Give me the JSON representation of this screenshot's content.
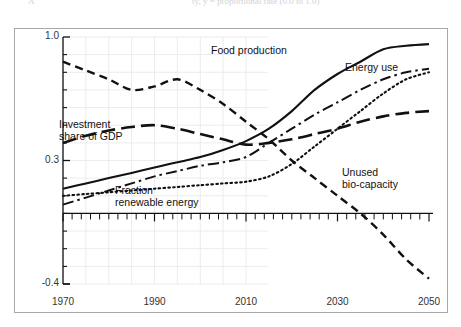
{
  "figure": {
    "cut_caption_left": "A",
    "cut_caption_right": "ty, y = proportional rate (0.0 to 1.0)",
    "frame_name": "figure-border"
  },
  "axes": {
    "y_ticks": [
      {
        "value": 1.0,
        "label": "1.0"
      },
      {
        "value": 0.3,
        "label": "0.3"
      },
      {
        "value": -0.4,
        "label": "-0.4"
      }
    ],
    "y_min": -0.4,
    "y_max": 1.0,
    "x_ticks": [
      {
        "value": 1970,
        "label": "1970"
      },
      {
        "value": 1990,
        "label": "1990"
      },
      {
        "value": 2010,
        "label": "2010"
      },
      {
        "value": 2030,
        "label": "2030"
      },
      {
        "value": 2050,
        "label": "2050"
      }
    ],
    "x_min": 1970,
    "x_max": 2050,
    "x_minor_tick_step": 2,
    "zero_line_value": 0,
    "grid": "faint light-grey grid in left portion only"
  },
  "series_labels": {
    "food_production": "Food production",
    "energy_use": "Energy use",
    "investment_share_of_gdp_line1": "Investment",
    "investment_share_of_gdp_line2": "share of GDP",
    "fraction_renewable_line1": "Fraction",
    "fraction_renewable_line2": "renewable energy",
    "unused_biocapacity_line1": "Unused",
    "unused_biocapacity_line2": "bio-capacity"
  },
  "colors": {
    "ink": "#111111",
    "frame": "#a8a8a8",
    "grid": "#ececed",
    "caption_faint": "#d2d2d6"
  },
  "chart_data": {
    "type": "line",
    "title": "",
    "xlabel": "",
    "ylabel": "",
    "xlim": [
      1970,
      2050
    ],
    "ylim": [
      -0.4,
      1.0
    ],
    "grid": true,
    "legend": "inline labels next to curves",
    "x": [
      1970,
      1975,
      1980,
      1985,
      1990,
      1995,
      2000,
      2005,
      2010,
      2015,
      2020,
      2025,
      2030,
      2035,
      2040,
      2045,
      2050
    ],
    "series": [
      {
        "name": "Food production",
        "style": "solid",
        "values": [
          0.14,
          0.17,
          0.2,
          0.23,
          0.26,
          0.29,
          0.32,
          0.36,
          0.41,
          0.48,
          0.58,
          0.7,
          0.79,
          0.86,
          0.93,
          0.95,
          0.96
        ]
      },
      {
        "name": "Energy use",
        "style": "dash-dot",
        "values": [
          0.05,
          0.09,
          0.13,
          0.17,
          0.21,
          0.24,
          0.27,
          0.29,
          0.32,
          0.4,
          0.48,
          0.56,
          0.63,
          0.7,
          0.76,
          0.8,
          0.82
        ]
      },
      {
        "name": "Investment share of GDP",
        "style": "long-dash",
        "values": [
          0.4,
          0.44,
          0.47,
          0.49,
          0.5,
          0.48,
          0.45,
          0.42,
          0.39,
          0.4,
          0.42,
          0.45,
          0.48,
          0.52,
          0.55,
          0.57,
          0.58
        ]
      },
      {
        "name": "Fraction renewable energy",
        "style": "dotted",
        "values": [
          0.1,
          0.11,
          0.12,
          0.13,
          0.14,
          0.15,
          0.16,
          0.17,
          0.18,
          0.21,
          0.28,
          0.38,
          0.48,
          0.58,
          0.68,
          0.76,
          0.8
        ]
      },
      {
        "name": "Unused bio-capacity",
        "style": "medium-dash",
        "values": [
          0.86,
          0.81,
          0.76,
          0.7,
          0.72,
          0.76,
          0.7,
          0.62,
          0.52,
          0.42,
          0.3,
          0.2,
          0.1,
          0.0,
          -0.12,
          -0.26,
          -0.37
        ]
      }
    ]
  }
}
